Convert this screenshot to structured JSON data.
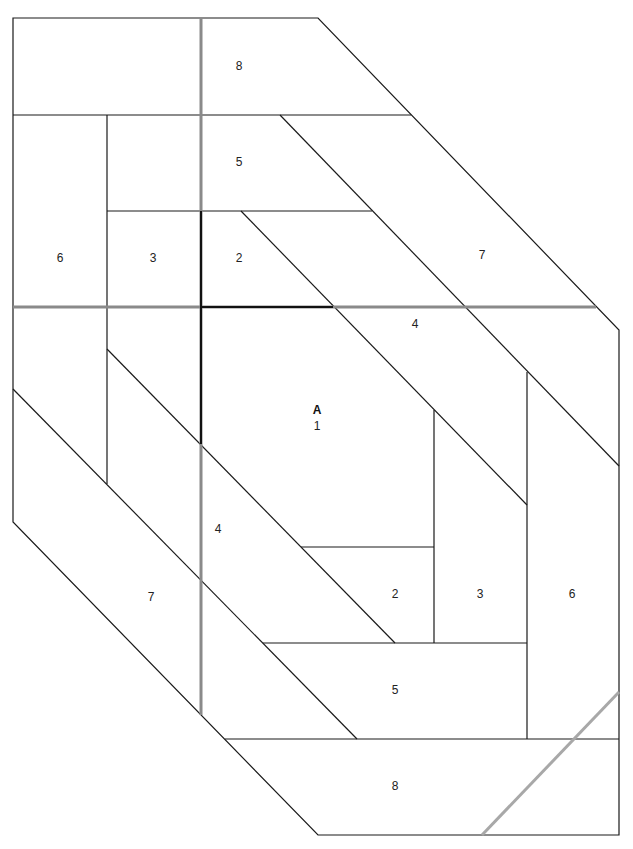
{
  "diagram": {
    "type": "foundation-paper-piecing-pattern",
    "section_label": "A",
    "piece_labels": [
      {
        "id": "p8-top",
        "text": "8",
        "x": 239,
        "y": 67
      },
      {
        "id": "p5-top",
        "text": "5",
        "x": 239,
        "y": 163
      },
      {
        "id": "p6-left",
        "text": "6",
        "x": 60,
        "y": 259
      },
      {
        "id": "p3-left",
        "text": "3",
        "x": 153,
        "y": 259
      },
      {
        "id": "p2-top",
        "text": "2",
        "x": 239,
        "y": 259
      },
      {
        "id": "p7-right",
        "text": "7",
        "x": 482,
        "y": 256
      },
      {
        "id": "p4-top",
        "text": "4",
        "x": 415,
        "y": 325
      },
      {
        "id": "p1-center",
        "text": "1",
        "x": 317,
        "y": 427
      },
      {
        "id": "p4-left",
        "text": "4",
        "x": 218,
        "y": 530
      },
      {
        "id": "p7-left",
        "text": "7",
        "x": 151,
        "y": 598
      },
      {
        "id": "p2-bottom",
        "text": "2",
        "x": 395,
        "y": 595
      },
      {
        "id": "p3-bottom",
        "text": "3",
        "x": 480,
        "y": 595
      },
      {
        "id": "p6-right",
        "text": "6",
        "x": 572,
        "y": 595
      },
      {
        "id": "p5-bottom",
        "text": "5",
        "x": 395,
        "y": 691
      },
      {
        "id": "p8-bottom",
        "text": "8",
        "x": 395,
        "y": 787
      }
    ],
    "section_label_pos": {
      "x": 317,
      "y": 411
    },
    "colors": {
      "line": "#1a1a1a",
      "seam": "#8a8a8a",
      "background": "#ffffff"
    }
  }
}
